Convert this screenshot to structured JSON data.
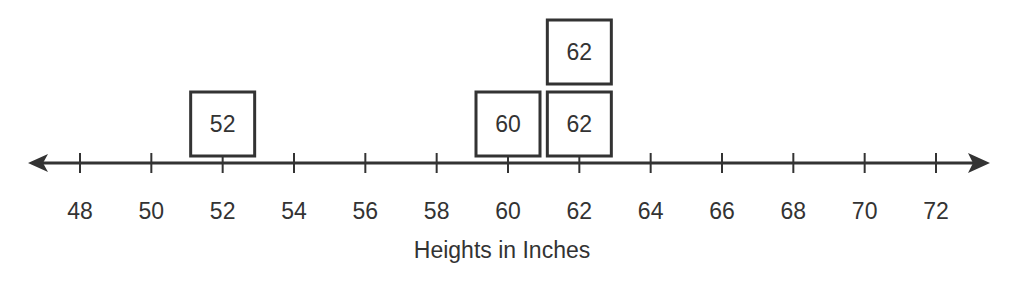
{
  "chart_data": {
    "type": "dot_plot",
    "title": "",
    "xlabel": "Heights in Inches",
    "ylabel": "",
    "xlim": [
      48,
      72
    ],
    "tick_step": 2,
    "ticks": [
      48,
      50,
      52,
      54,
      56,
      58,
      60,
      62,
      64,
      66,
      68,
      70,
      72
    ],
    "tick_labels": [
      "48",
      "50",
      "52",
      "54",
      "56",
      "58",
      "60",
      "62",
      "64",
      "66",
      "68",
      "70",
      "72"
    ],
    "values": [
      52,
      60,
      62,
      62
    ],
    "stacks": [
      {
        "x": 52,
        "boxes": [
          "52"
        ]
      },
      {
        "x": 60,
        "boxes": [
          "60"
        ]
      },
      {
        "x": 62,
        "boxes": [
          "62",
          "62"
        ]
      }
    ],
    "marker": "labeled-square",
    "grid": false,
    "legend": null,
    "arrows": "both-ends"
  },
  "colors": {
    "line": "#333333",
    "text": "#333333",
    "box_fill": "#ffffff",
    "background": "#ffffff"
  }
}
